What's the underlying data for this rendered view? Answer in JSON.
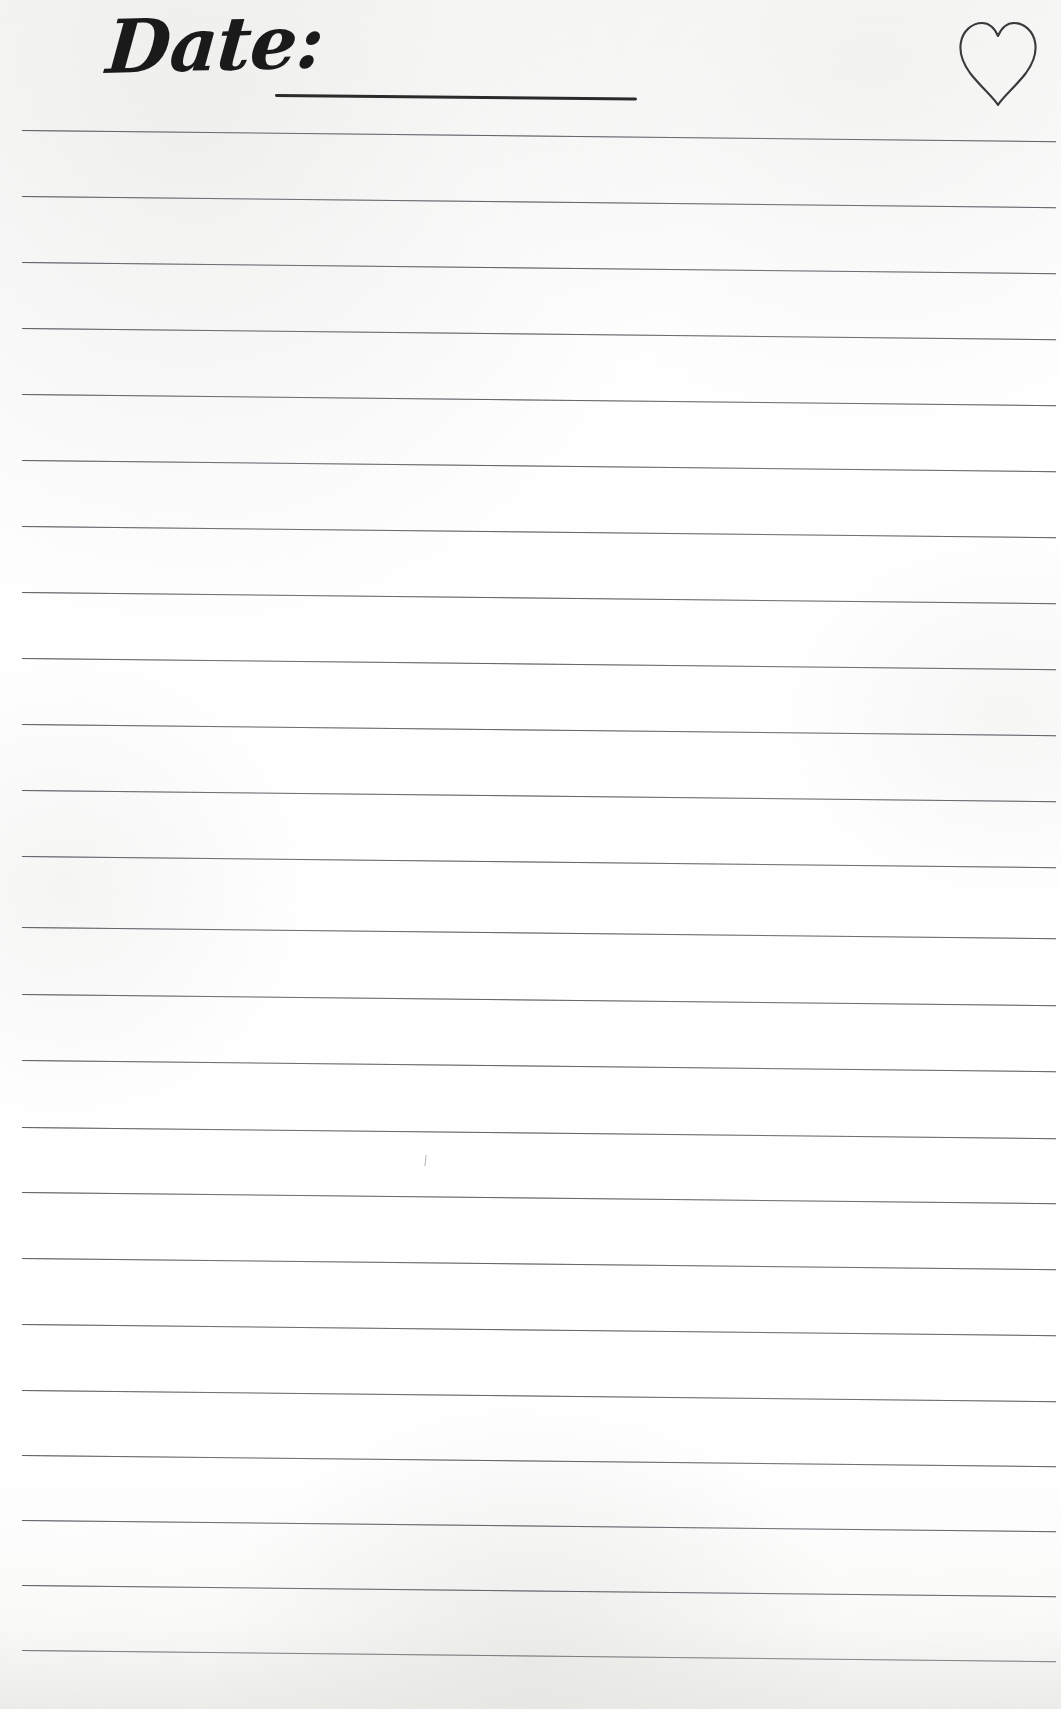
{
  "page": {
    "width": 1061,
    "height": 1709,
    "background_color": "#fdfdfc",
    "paper_tint": "#f7f7f5"
  },
  "header": {
    "date_label": "Date:",
    "date_field_value": "",
    "date_field_placeholder": "",
    "date_rule": {
      "x": 275,
      "y": 96,
      "width": 362,
      "thickness": 3,
      "color": "#2b2b2b"
    },
    "heart_icon": {
      "name": "heart-icon",
      "style": "outline",
      "stroke_color": "#3a3a3c",
      "stroke_width": 2,
      "x": 958,
      "y": 20,
      "width": 80,
      "height": 88
    }
  },
  "body": {
    "rule_color": "#5f6168",
    "rule_thickness": 1,
    "rule_left": 22,
    "rule_right": 1056,
    "rule_rotation_deg": 0.62,
    "first_rule_y": 130,
    "rule_spacing": 66,
    "rule_count": 24,
    "rule_positions_y": [
      130,
      196,
      262,
      328,
      394,
      460,
      526,
      592,
      658,
      724,
      790,
      856,
      927,
      994,
      1060,
      1127,
      1192,
      1258,
      1324,
      1390,
      1455,
      1520,
      1585,
      1650
    ],
    "lines_text": [
      "",
      "",
      "",
      "",
      "",
      "",
      "",
      "",
      "",
      "",
      "",
      "",
      "",
      "",
      "",
      "",
      "",
      "",
      "",
      "",
      "",
      "",
      "",
      ""
    ],
    "pencil_mark": {
      "name": "pencil-tick-mark",
      "x": 425,
      "y": 1155,
      "color": "#5a5a5f"
    }
  }
}
